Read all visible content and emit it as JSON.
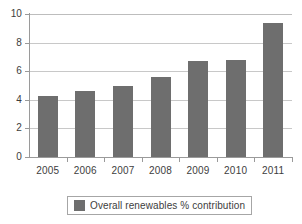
{
  "chart_data": {
    "type": "bar",
    "title": "",
    "xlabel": "",
    "ylabel": "",
    "ylim": [
      0,
      10
    ],
    "ytick_values": [
      0,
      2,
      4,
      6,
      8,
      10
    ],
    "ytick_labels": [
      "0",
      "2",
      "4",
      "6",
      "8",
      "10"
    ],
    "grid": true,
    "categories": [
      "2005",
      "2006",
      "2007",
      "2008",
      "2009",
      "2010",
      "2011"
    ],
    "series": [
      {
        "name": "Overall renewables % contribution",
        "color": "#6e6e6e",
        "values": [
          4.3,
          4.6,
          5.0,
          5.6,
          6.7,
          6.8,
          9.4
        ]
      }
    ],
    "legend": {
      "position": "bottom",
      "entries": [
        {
          "label": "Overall renewables % contribution",
          "color": "#6e6e6e"
        }
      ]
    },
    "colors": {
      "bar": "#6e6e6e",
      "gridline": "#c8c8c8",
      "axis": "#9a9a9a",
      "text": "#3d3d3d",
      "background": "#ffffff"
    }
  }
}
